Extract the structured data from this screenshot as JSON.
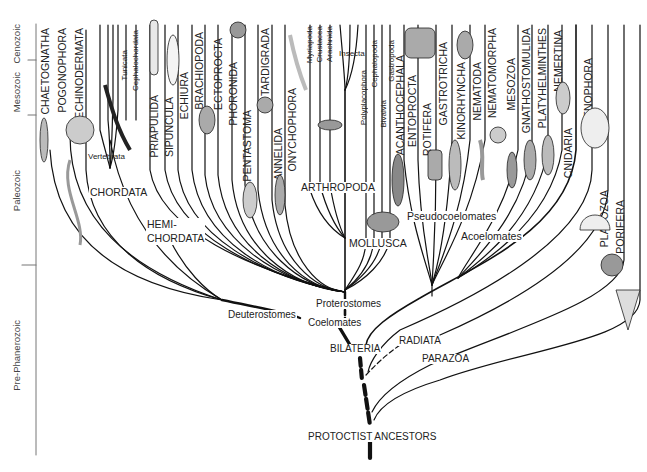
{
  "timescale": {
    "eras": [
      {
        "label": "Cenozoic"
      },
      {
        "label": "Mesozoic"
      },
      {
        "label": "Paleozoic"
      },
      {
        "label": "Pre-Phanerozoic"
      }
    ]
  },
  "phyla": [
    {
      "label": "CHAETOGNATHA"
    },
    {
      "label": "POGONOPHORA"
    },
    {
      "label": "ECHINODERMATA"
    },
    {
      "label": "Tunicata"
    },
    {
      "label": "Cephalochordata"
    },
    {
      "label": "Vertebrata"
    },
    {
      "label": "PRIAPULIDA"
    },
    {
      "label": "SIPUNCULA"
    },
    {
      "label": "ECHIURA"
    },
    {
      "label": "BRACHIOPODA"
    },
    {
      "label": "ECTOPROCTA"
    },
    {
      "label": "PHORONIDA"
    },
    {
      "label": "PENTASTOMA"
    },
    {
      "label": "TARDIGRADA"
    },
    {
      "label": "ANNELIDA"
    },
    {
      "label": "ONYCHOPHORA"
    },
    {
      "label": "Myriapoda"
    },
    {
      "label": "Crustacea"
    },
    {
      "label": "Arachnida"
    },
    {
      "label": "Insecta"
    },
    {
      "label": "Polyplacophora"
    },
    {
      "label": "Cephalopoda"
    },
    {
      "label": "Bivalvia"
    },
    {
      "label": "Gastropoda"
    },
    {
      "label": "ACANTHOCEPHALA"
    },
    {
      "label": "ENTOPROCTA"
    },
    {
      "label": "ROTIFERA"
    },
    {
      "label": "GASTROTRICHA"
    },
    {
      "label": "KINORHYNCHA"
    },
    {
      "label": "NEMATODA"
    },
    {
      "label": "NEMATOMORPHA"
    },
    {
      "label": "MESOZOA"
    },
    {
      "label": "GNATHOSTOMULIDA"
    },
    {
      "label": "PLATYHELMINTHES"
    },
    {
      "label": "NEMERTINA"
    },
    {
      "label": "CNIDARIA"
    },
    {
      "label": "CTENOPHORA"
    },
    {
      "label": "PLACOZOA"
    },
    {
      "label": "PORIFERA"
    }
  ],
  "groups": {
    "chordata": "CHORDATA",
    "hemichordata": "HEMI-\nCHORDATA",
    "arthropoda": "ARTHROPODA",
    "mollusca": "MOLLUSCA",
    "pseudocoelomates": "Pseudocoelomates",
    "acoelomates": "Acoelomates"
  },
  "nodes": {
    "deuterostomes": "Deuterostomes",
    "proterostomes": "Proterostomes",
    "coelomates": "Coelomates",
    "bilateria": "BILATERIA",
    "radiata": "RADIATA",
    "parazoa": "PARAZOA",
    "root": "PROTOCTIST ANCESTORS"
  },
  "colors": {
    "line": "#111111",
    "text": "#222222",
    "axis": "#666666"
  }
}
